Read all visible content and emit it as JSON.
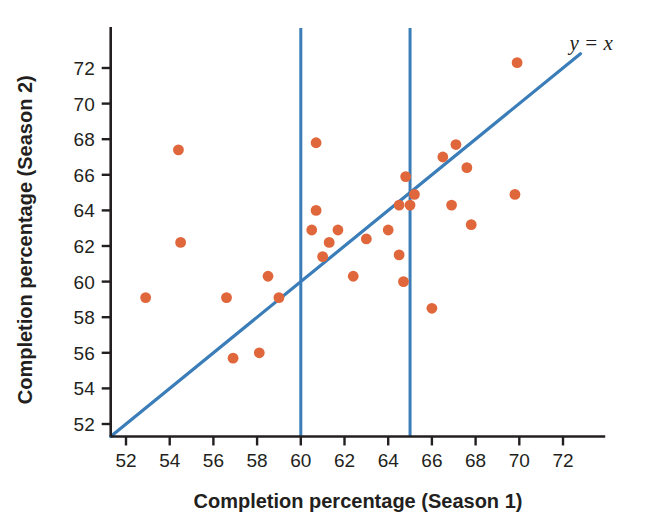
{
  "chart_data": {
    "type": "scatter",
    "title": "",
    "xlabel": "Completion percentage (Season 1)",
    "ylabel": "Completion percentage (Season 2)",
    "xlim": [
      51.3,
      73.2
    ],
    "ylim": [
      51.3,
      73.4
    ],
    "xticks": [
      52,
      54,
      56,
      58,
      60,
      62,
      64,
      66,
      68,
      70,
      72
    ],
    "yticks": [
      52,
      54,
      56,
      58,
      60,
      62,
      64,
      66,
      68,
      70,
      72
    ],
    "xtick_labels": [
      "52",
      "54",
      "56",
      "58",
      "60",
      "62",
      "64",
      "66",
      "68",
      "70",
      "72"
    ],
    "ytick_labels": [
      "52",
      "54",
      "56",
      "58",
      "60",
      "62",
      "64",
      "66",
      "68",
      "70",
      "72"
    ],
    "grid": false,
    "legend": "none",
    "point_color": "#e0663c",
    "line_color": "#3a7db8",
    "axis_color": "#231f20",
    "background": "#ffffff",
    "annotations": [
      {
        "text": "y = x",
        "x": 72.3,
        "y": 73.0,
        "name": "identity-line-label"
      }
    ],
    "reference_lines": [
      {
        "name": "identity-line",
        "kind": "diagonal",
        "equation": "y = x",
        "from": [
          51.3,
          51.3
        ],
        "to": [
          72.8,
          72.8
        ],
        "color": "#3a7db8"
      },
      {
        "name": "vertical-line-60",
        "kind": "vertical",
        "x": 60.0,
        "color": "#3a7db8"
      },
      {
        "name": "vertical-line-65",
        "kind": "vertical",
        "x": 65.0,
        "color": "#3a7db8"
      }
    ],
    "points": [
      {
        "x": 54.4,
        "y": 67.4
      },
      {
        "x": 54.5,
        "y": 62.2
      },
      {
        "x": 52.9,
        "y": 59.1
      },
      {
        "x": 56.6,
        "y": 59.1
      },
      {
        "x": 56.9,
        "y": 55.7
      },
      {
        "x": 58.5,
        "y": 60.3
      },
      {
        "x": 58.1,
        "y": 56.0
      },
      {
        "x": 59.0,
        "y": 59.1
      },
      {
        "x": 60.7,
        "y": 67.8
      },
      {
        "x": 60.7,
        "y": 64.0
      },
      {
        "x": 60.5,
        "y": 62.9
      },
      {
        "x": 61.7,
        "y": 62.9
      },
      {
        "x": 61.3,
        "y": 62.2
      },
      {
        "x": 61.0,
        "y": 61.4
      },
      {
        "x": 62.4,
        "y": 60.3
      },
      {
        "x": 63.0,
        "y": 62.4
      },
      {
        "x": 64.0,
        "y": 62.9
      },
      {
        "x": 64.8,
        "y": 65.9
      },
      {
        "x": 65.2,
        "y": 64.9
      },
      {
        "x": 64.5,
        "y": 64.3
      },
      {
        "x": 65.0,
        "y": 64.3
      },
      {
        "x": 64.5,
        "y": 61.5
      },
      {
        "x": 64.7,
        "y": 60.0
      },
      {
        "x": 66.5,
        "y": 67.0
      },
      {
        "x": 67.1,
        "y": 67.7
      },
      {
        "x": 67.6,
        "y": 66.4
      },
      {
        "x": 66.9,
        "y": 64.3
      },
      {
        "x": 67.8,
        "y": 63.2
      },
      {
        "x": 66.0,
        "y": 58.5
      },
      {
        "x": 69.9,
        "y": 72.3
      },
      {
        "x": 69.8,
        "y": 64.9
      }
    ]
  }
}
